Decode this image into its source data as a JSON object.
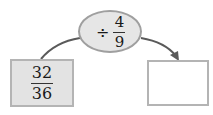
{
  "diagram": {
    "type": "operation-flow",
    "input": {
      "numerator": "32",
      "denominator": "36"
    },
    "operation": {
      "symbol": "÷",
      "numerator": "4",
      "denominator": "9"
    },
    "output": {
      "value": ""
    }
  },
  "colors": {
    "input_fill": "#e3e3e3",
    "border": "#b4b4b4",
    "oval_fill": "#e6e6e6",
    "arrow": "#5a5a5a"
  }
}
